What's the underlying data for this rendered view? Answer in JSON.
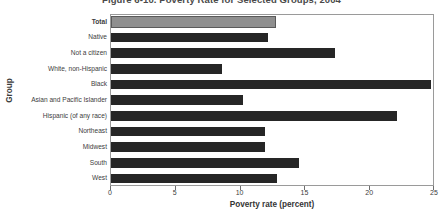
{
  "chart_data": {
    "type": "bar",
    "orientation": "horizontal",
    "title": "Figure 6-10. Poverty Rate for Selected Groups, 2004",
    "xlabel": "Poverty rate (percent)",
    "ylabel": "Group",
    "xlim": [
      0,
      25
    ],
    "xticks": [
      0,
      5,
      10,
      15,
      20,
      25
    ],
    "xtick_labels": [
      "0",
      "5",
      "10",
      "15",
      "20",
      "25"
    ],
    "grid": false,
    "legend": null,
    "categories": [
      "Total",
      "Native",
      "Not a citizen",
      "White, non-Hispanic",
      "Black",
      "Asian and Pacific Islander",
      "Hispanic (of any race)",
      "Northeast",
      "Midwest",
      "South",
      "West"
    ],
    "values": [
      12.7,
      12.1,
      17.3,
      8.6,
      24.7,
      10.2,
      22.1,
      11.9,
      11.9,
      14.5,
      12.8
    ],
    "highlight_index": 0,
    "colors": {
      "bar": "#262626",
      "highlight_bar": "#8f8f8f",
      "highlight_border": "#5a5a5a",
      "frame": "#9a9a9a",
      "text": "#3d3d3d",
      "background": "#ffffff"
    }
  }
}
